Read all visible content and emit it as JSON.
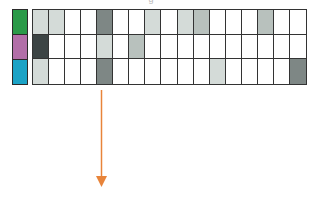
{
  "top_fragment": "' ' g",
  "strip": {
    "colors": [
      "#2a9a48",
      "#b26fa8",
      "#1ba3c6"
    ]
  },
  "shade_colors": {
    "0": "#ffffff",
    "1": "#d4dbd8",
    "2": "#b8c1bd",
    "3": "#7e8785",
    "4": "#3c4444"
  },
  "grid": {
    "columns": 17,
    "rows": [
      [
        1,
        1,
        0,
        0,
        3,
        0,
        0,
        1,
        0,
        1,
        2,
        0,
        0,
        0,
        2,
        0,
        0
      ],
      [
        4,
        0,
        0,
        0,
        1,
        0,
        2,
        0,
        0,
        0,
        0,
        0,
        0,
        0,
        0,
        0,
        0
      ],
      [
        1,
        0,
        0,
        0,
        3,
        0,
        0,
        0,
        0,
        0,
        0,
        1,
        0,
        0,
        0,
        0,
        3
      ]
    ]
  },
  "arrow": {
    "color": "#e8843a",
    "direction": "down"
  }
}
